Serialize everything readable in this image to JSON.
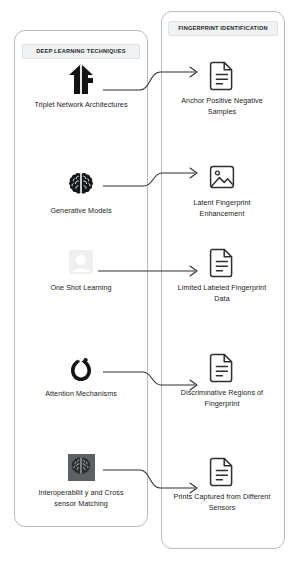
{
  "diagram": {
    "groups": [
      {
        "id": "deep-learning-techniques",
        "title": "DEEP LEARNING TECHNIQUES"
      },
      {
        "id": "fingerprint-identification",
        "title": "FINGERPRINT IDENTIFICATION"
      }
    ],
    "left_nodes": [
      {
        "label": "Triplet Network Architectures",
        "icon": "triplet-network-icon"
      },
      {
        "label": "Generative Models",
        "icon": "brain-icon"
      },
      {
        "label": "One Shot Learning",
        "icon": "one-shot-icon"
      },
      {
        "label": "Attention Mechanisms",
        "icon": "pytorch-flame-icon"
      },
      {
        "label": "Interoperabilit y and Cross sensor Matching",
        "icon": "brain-tile-icon"
      }
    ],
    "right_nodes": [
      {
        "label": "Anchor Positive Negative Samples",
        "icon": "document-icon"
      },
      {
        "label": "Latent Fingerprint Enhancement",
        "icon": "image-icon"
      },
      {
        "label": "Limited Labeled Fingerprint Data",
        "icon": "document-icon"
      },
      {
        "label": "Discriminative Regions of Fingerprint",
        "icon": "document-icon"
      },
      {
        "label": "Prints Captured from Different Sensors",
        "icon": "document-icon"
      }
    ],
    "connectors": [
      {
        "from": "Triplet Network Architectures",
        "to": "Anchor Positive Negative Samples",
        "shape": "s-curve-up"
      },
      {
        "from": "Generative Models",
        "to": "Latent Fingerprint Enhancement",
        "shape": "s-curve-up"
      },
      {
        "from": "One Shot Learning",
        "to": "Limited Labeled Fingerprint Data",
        "shape": "straight"
      },
      {
        "from": "Attention Mechanisms",
        "to": "Discriminative Regions of Fingerprint",
        "shape": "s-curve-down"
      },
      {
        "from": "Interoperabilit y and Cross sensor Matching",
        "to": "Prints Captured from Different Sensors",
        "shape": "s-curve-down"
      }
    ],
    "colors": {
      "stroke": "#2c2f33",
      "group_border": "#b9bcc0",
      "title_chip_bg": "#f1f2f3",
      "icon_tile_bg": "#5d6166",
      "background": "#ffffff"
    }
  }
}
